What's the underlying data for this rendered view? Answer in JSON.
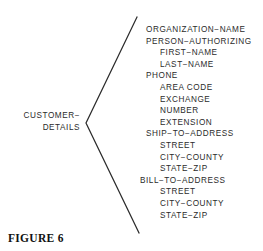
{
  "figure": {
    "caption": "FIGURE 6"
  },
  "entity": {
    "name_line_1": "CUSTOMER−",
    "name_line_2": "DETAILS"
  },
  "bracket": {
    "shape": "angle-bracket-open-right",
    "color": "#2b2b2b",
    "apex_x": 86,
    "apex_y": 123,
    "top_x": 137,
    "top_y": 17,
    "bottom_x": 139,
    "bottom_y": 233
  },
  "fields": [
    {
      "label": "ORGANIZATION−NAME",
      "level": 0
    },
    {
      "label": "PERSON−AUTHORIZING",
      "level": 0
    },
    {
      "label": "FIRST−NAME",
      "level": 1
    },
    {
      "label": "LAST−NAME",
      "level": 1
    },
    {
      "label": "PHONE",
      "level": 0
    },
    {
      "label": "AREA CODE",
      "level": 1
    },
    {
      "label": "EXCHANGE",
      "level": 1
    },
    {
      "label": "NUMBER",
      "level": 1
    },
    {
      "label": "EXTENSION",
      "level": 1
    },
    {
      "label": "SHIP−TO−ADDRESS",
      "level": 0
    },
    {
      "label": "STREET",
      "level": 1
    },
    {
      "label": "CITY−COUNTY",
      "level": 1
    },
    {
      "label": "STATE−ZIP",
      "level": 1
    },
    {
      "label": "BILL−TO−ADDRESS",
      "level": 0,
      "outdent": true
    },
    {
      "label": "STREET",
      "level": 1
    },
    {
      "label": "CITY−COUNTY",
      "level": 1
    },
    {
      "label": "STATE−ZIP",
      "level": 1
    }
  ]
}
